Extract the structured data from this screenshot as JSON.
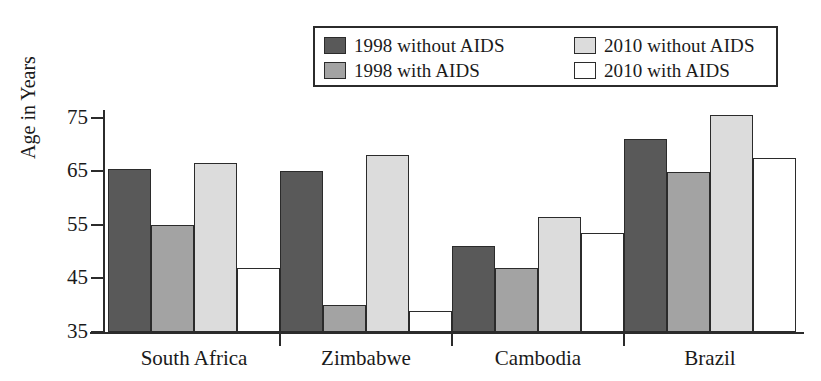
{
  "chart_data": {
    "type": "bar",
    "title": "",
    "xlabel": "",
    "ylabel": "Age in Years",
    "ylim": [
      35,
      78
    ],
    "yticks": [
      35,
      45,
      55,
      65,
      75
    ],
    "grid": false,
    "legend_position": "top-center",
    "categories": [
      "South Africa",
      "Zimbabwe",
      "Cambodia",
      "Brazil"
    ],
    "series": [
      {
        "name": "1998 without AIDS",
        "color": "#595959",
        "values": [
          65.5,
          65.0,
          51.0,
          71.0
        ]
      },
      {
        "name": "1998 with AIDS",
        "color": "#a3a3a3",
        "values": [
          55.0,
          40.0,
          47.0,
          64.8
        ]
      },
      {
        "name": "2010 without AIDS",
        "color": "#dcdcdc",
        "values": [
          66.5,
          68.0,
          56.5,
          75.5
        ]
      },
      {
        "name": "2010 with AIDS",
        "color": "#ffffff",
        "values": [
          47.0,
          39.0,
          53.5,
          67.5
        ]
      }
    ]
  },
  "legend": {
    "entries": [
      {
        "label": "1998 without AIDS",
        "color": "#595959"
      },
      {
        "label": "2010 without AIDS",
        "color": "#dcdcdc"
      },
      {
        "label": "1998 with AIDS",
        "color": "#a3a3a3"
      },
      {
        "label": "2010 with AIDS",
        "color": "#ffffff"
      }
    ]
  },
  "axes": {
    "y_title": "Age in Years",
    "y_tick_labels": [
      "75",
      "65",
      "55",
      "45",
      "35"
    ],
    "x_tick_labels": [
      "South Africa",
      "Zimbabwe",
      "Cambodia",
      "Brazil"
    ]
  }
}
